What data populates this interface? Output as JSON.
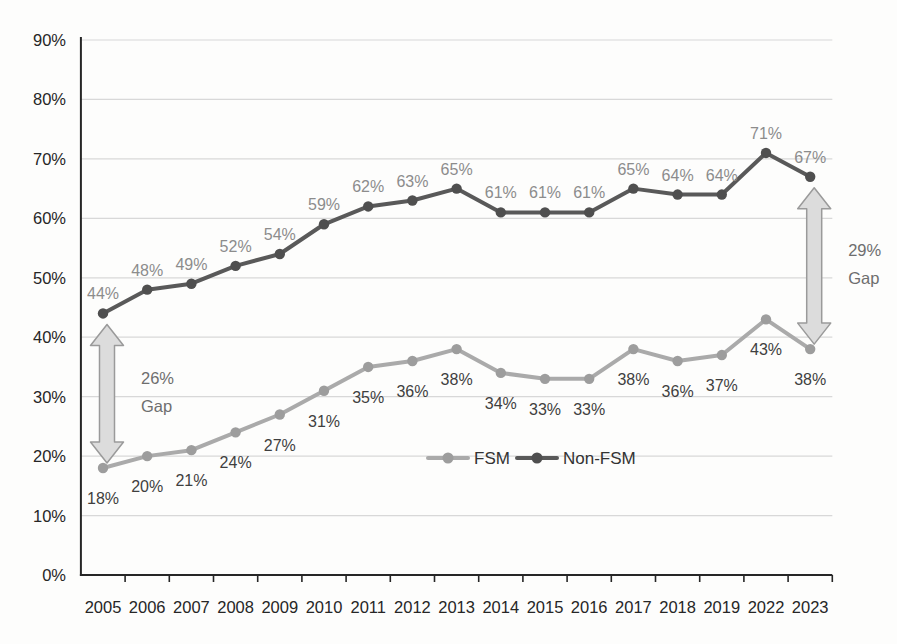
{
  "chart_data": {
    "type": "line",
    "title": "",
    "categories": [
      "2005",
      "2006",
      "2007",
      "2008",
      "2009",
      "2010",
      "2011",
      "2012",
      "2013",
      "2014",
      "2015",
      "2016",
      "2017",
      "2018",
      "2019",
      "2022",
      "2023"
    ],
    "series": [
      {
        "name": "FSM",
        "values": [
          18,
          20,
          21,
          24,
          27,
          31,
          35,
          36,
          38,
          34,
          33,
          33,
          38,
          36,
          37,
          43,
          38
        ],
        "color": "#aaaaaa",
        "marker_color": "#9d9d9d",
        "label_color": "#3f3f3f",
        "label_position": "below"
      },
      {
        "name": "Non-FSM",
        "values": [
          44,
          48,
          49,
          52,
          54,
          59,
          62,
          63,
          65,
          61,
          61,
          61,
          65,
          64,
          64,
          71,
          67
        ],
        "color": "#595959",
        "marker_color": "#4f4f4f",
        "label_color": "#8c8c8c",
        "label_position": "above"
      }
    ],
    "ylim": [
      0,
      90
    ],
    "ytick_step": 10,
    "ytick_labels": [
      "0%",
      "10%",
      "20%",
      "30%",
      "40%",
      "50%",
      "60%",
      "70%",
      "80%",
      "90%"
    ],
    "value_suffix": "%",
    "grid": true,
    "legend_position": "inside-plot-center",
    "legend_entries": [
      "FSM",
      "Non-FSM"
    ],
    "annotations": [
      {
        "type": "double-arrow",
        "category": "2005",
        "low_value": 18,
        "high_value": 44,
        "label_lines": [
          "26%",
          "Gap"
        ]
      },
      {
        "type": "double-arrow",
        "category": "2023",
        "low_value": 38,
        "high_value": 67,
        "label_lines": [
          "29%",
          "Gap"
        ]
      }
    ],
    "colors": {
      "grid": "#d8d8d8",
      "axis": "#262626",
      "axis_text": "#262626",
      "legend_text": "#333333",
      "gap_text": "#6e6e6e",
      "arrow_fill": "#dcdcdc",
      "arrow_stroke": "#9a9a9a"
    }
  }
}
